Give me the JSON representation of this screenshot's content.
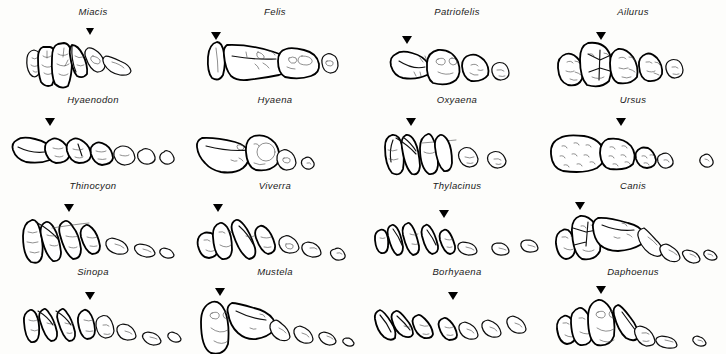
{
  "figure": {
    "panel_count": 16,
    "columns": 4,
    "rows": 4,
    "marker_glyph": "▼",
    "marker_meaning": "carnassial-tooth-indicator",
    "ink_color": "#0d0d0d",
    "background_color": "#fdfdfb",
    "label_style": "italic"
  },
  "panels": [
    {
      "label": "Miacis",
      "marker": true,
      "teeth": 6,
      "row": 1,
      "col": 1
    },
    {
      "label": "Felis",
      "marker": true,
      "teeth": 4,
      "row": 1,
      "col": 2
    },
    {
      "label": "Patriofelis",
      "marker": true,
      "teeth": 4,
      "row": 1,
      "col": 3
    },
    {
      "label": "Ailurus",
      "marker": true,
      "teeth": 5,
      "row": 1,
      "col": 4
    },
    {
      "label": "Hyaenodon",
      "marker": true,
      "teeth": 7,
      "row": 2,
      "col": 1
    },
    {
      "label": "Hyaena",
      "marker": false,
      "teeth": 5,
      "row": 2,
      "col": 2
    },
    {
      "label": "Oxyaena",
      "marker": true,
      "teeth": 5,
      "row": 2,
      "col": 3
    },
    {
      "label": "Ursus",
      "marker": true,
      "teeth": 6,
      "row": 2,
      "col": 4
    },
    {
      "label": "Thinocyon",
      "marker": true,
      "teeth": 6,
      "row": 3,
      "col": 1
    },
    {
      "label": "Viverra",
      "marker": true,
      "teeth": 7,
      "row": 3,
      "col": 2
    },
    {
      "label": "Thylacinus",
      "marker": true,
      "teeth": 8,
      "row": 3,
      "col": 3
    },
    {
      "label": "Canis",
      "marker": true,
      "teeth": 8,
      "row": 3,
      "col": 4
    },
    {
      "label": "Sinopa",
      "marker": true,
      "teeth": 8,
      "row": 4,
      "col": 1
    },
    {
      "label": "Mustela",
      "marker": true,
      "teeth": 6,
      "row": 4,
      "col": 2
    },
    {
      "label": "Borhyaena",
      "marker": true,
      "teeth": 7,
      "row": 4,
      "col": 3
    },
    {
      "label": "Daphoenus",
      "marker": true,
      "teeth": 7,
      "row": 4,
      "col": 4
    }
  ]
}
